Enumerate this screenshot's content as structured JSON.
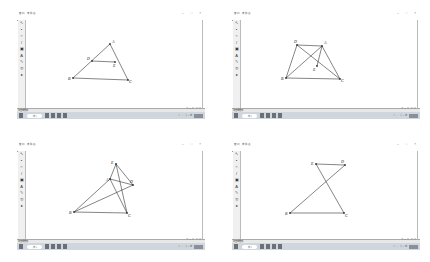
{
  "panels": [
    {
      "id": "top-left",
      "window": {
        "title": "窗口 - 未命名",
        "controls": "– □ ×"
      },
      "menu": [
        "文件",
        "编辑",
        "显示",
        "构造",
        "变换",
        "度量",
        "数据",
        "绘图",
        "窗口",
        "帮助"
      ],
      "toolbar": [
        "↖",
        "•",
        "○",
        "/",
        "▣",
        "A",
        "✎",
        "①",
        "▸"
      ],
      "status": {
        "left": "单击或拖动",
        "right": "□ • ☐ ☐ ☐"
      },
      "taskbar": {
        "search": "搜索",
        "tray": "∧ □ ⌘ • 中"
      },
      "figure": {
        "points": [
          {
            "name": "A",
            "x": 84,
            "y": 24,
            "lx": 86,
            "ly": 23
          },
          {
            "name": "D",
            "x": 66,
            "y": 41,
            "lx": 61,
            "ly": 40
          },
          {
            "name": "E",
            "x": 89,
            "y": 42,
            "lx": 87,
            "ly": 47
          },
          {
            "name": "B",
            "x": 47,
            "y": 58,
            "lx": 42,
            "ly": 60
          },
          {
            "name": "C",
            "x": 102,
            "y": 60,
            "lx": 103,
            "ly": 63
          }
        ],
        "segments": [
          [
            "A",
            "B"
          ],
          [
            "A",
            "C"
          ],
          [
            "D",
            "E"
          ],
          [
            "B",
            "C"
          ]
        ]
      }
    },
    {
      "id": "top-right",
      "window": {
        "title": "窗口 - 未命名",
        "controls": "– □ ×"
      },
      "menu": [
        "文件",
        "编辑",
        "显示",
        "构造",
        "变换",
        "度量",
        "数据",
        "绘图",
        "窗口",
        "帮助"
      ],
      "toolbar": [
        "↖",
        "•",
        "○",
        "/",
        "▣",
        "A",
        "✎",
        "①",
        "▸"
      ],
      "status": {
        "left": "单击或拖动",
        "right": "□ • ☐ ☐ ☐"
      },
      "taskbar": {
        "search": "搜索",
        "tray": "∧ □ ⌘ • 中"
      },
      "figure": {
        "points": [
          {
            "name": "D",
            "x": 56,
            "y": 25,
            "lx": 53,
            "ly": 23
          },
          {
            "name": "A",
            "x": 81,
            "y": 26,
            "lx": 83,
            "ly": 24
          },
          {
            "name": "E",
            "x": 76,
            "y": 46,
            "lx": 72,
            "ly": 51
          },
          {
            "name": "B",
            "x": 45,
            "y": 58,
            "lx": 40,
            "ly": 60
          },
          {
            "name": "C",
            "x": 99,
            "y": 59,
            "lx": 100,
            "ly": 62
          }
        ],
        "segments": [
          [
            "D",
            "A"
          ],
          [
            "D",
            "B"
          ],
          [
            "A",
            "C"
          ],
          [
            "B",
            "C"
          ],
          [
            "D",
            "C"
          ],
          [
            "A",
            "B"
          ],
          [
            "A",
            "E"
          ]
        ]
      }
    },
    {
      "id": "bottom-left",
      "window": {
        "title": "窗口 - 未命名",
        "controls": "– □ ×"
      },
      "menu": [
        "文件",
        "编辑",
        "显示",
        "构造",
        "变换",
        "度量",
        "数据",
        "绘图",
        "窗口",
        "帮助"
      ],
      "toolbar": [
        "↖",
        "•",
        "○",
        "/",
        "▣",
        "A",
        "✎",
        "①",
        "▸"
      ],
      "status": {
        "left": "单击或拖动",
        "right": "□ • ☐ ☐ ☐"
      },
      "taskbar": {
        "search": "搜索",
        "tray": "∧ □ ⌘ • 中"
      },
      "figure": {
        "points": [
          {
            "name": "E",
            "x": 90,
            "y": 13,
            "lx": 85,
            "ly": 13
          },
          {
            "name": "A",
            "x": 84,
            "y": 28,
            "lx": 80,
            "ly": 30
          },
          {
            "name": "D",
            "x": 107,
            "y": 34,
            "lx": 104,
            "ly": 32
          },
          {
            "name": "B",
            "x": 48,
            "y": 61,
            "lx": 43,
            "ly": 63
          },
          {
            "name": "C",
            "x": 101,
            "y": 62,
            "lx": 102,
            "ly": 66
          }
        ],
        "segments": [
          [
            "E",
            "D"
          ],
          [
            "E",
            "C"
          ],
          [
            "A",
            "B"
          ],
          [
            "A",
            "D"
          ],
          [
            "B",
            "C"
          ],
          [
            "B",
            "D"
          ],
          [
            "A",
            "C"
          ],
          [
            "E",
            "A"
          ]
        ]
      }
    },
    {
      "id": "bottom-right",
      "window": {
        "title": "窗口 - 未命名",
        "controls": "– □ ×"
      },
      "menu": [
        "文件",
        "编辑",
        "显示",
        "构造",
        "变换",
        "度量",
        "数据",
        "绘图",
        "窗口",
        "帮助"
      ],
      "toolbar": [
        "↖",
        "•",
        "○",
        "/",
        "▣",
        "A",
        "✎",
        "①",
        "▸"
      ],
      "status": {
        "left": "单击或拖动",
        "right": "□ • ☐ ☐ ☐"
      },
      "taskbar": {
        "search": "搜索",
        "tray": "∧ □ ⌘ • 中"
      },
      "figure": {
        "points": [
          {
            "name": "E",
            "x": 75,
            "y": 13,
            "lx": 70,
            "ly": 14
          },
          {
            "name": "D",
            "x": 104,
            "y": 14,
            "lx": 100,
            "ly": 12
          },
          {
            "name": "B",
            "x": 49,
            "y": 62,
            "lx": 44,
            "ly": 64
          },
          {
            "name": "C",
            "x": 103,
            "y": 62,
            "lx": 104,
            "ly": 66
          }
        ],
        "segments": [
          [
            "E",
            "D"
          ],
          [
            "E",
            "C"
          ],
          [
            "B",
            "D"
          ],
          [
            "B",
            "C"
          ]
        ]
      }
    }
  ]
}
